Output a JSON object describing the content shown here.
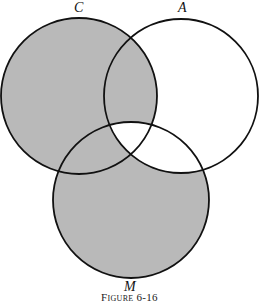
{
  "diagram": {
    "type": "venn",
    "sets": [
      {
        "id": "C",
        "label": "C",
        "cx": 79,
        "cy": 96,
        "r": 78
      },
      {
        "id": "A",
        "label": "A",
        "cx": 181,
        "cy": 96,
        "r": 77
      },
      {
        "id": "M",
        "label": "M",
        "cx": 131,
        "cy": 200,
        "r": 78
      }
    ],
    "shaded_regions": [
      "C only",
      "M only",
      "C and A not M",
      "C and M not A"
    ],
    "unshaded_regions": [
      "A only",
      "A and M not C",
      "A and C and M"
    ],
    "colors": {
      "shade": "#b9b9b9",
      "stroke": "#111111",
      "background": "#ffffff"
    }
  },
  "labels": {
    "c": "C",
    "a": "A",
    "m": "M"
  },
  "caption": "Figure 6-16"
}
